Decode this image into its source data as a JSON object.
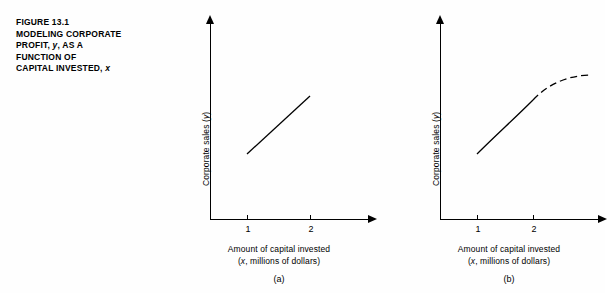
{
  "caption": {
    "figure_label": "FIGURE 13.1",
    "lines": [
      "MODELING CORPORATE",
      "PROFIT, y, AS A",
      "FUNCTION OF",
      "CAPITAL INVESTED, x"
    ]
  },
  "panels": [
    {
      "sub_label": "(a)",
      "ylabel": "Corporate sales (y)",
      "xlabel_line1": "Amount of capital invested",
      "xlabel_line2": "(x, millions of dollars)",
      "ticks": [
        "1",
        "2"
      ]
    },
    {
      "sub_label": "(b)",
      "ylabel": "Corporate sales (y)",
      "xlabel_line1": "Amount of capital invested",
      "xlabel_line2": "(x, millions of dollars)",
      "ticks": [
        "1",
        "2"
      ]
    }
  ],
  "chart_data": {
    "type": "line",
    "title": "FIGURE 13.1 MODELING CORPORATE PROFIT, y, AS A FUNCTION OF CAPITAL INVESTED, x",
    "xlabel": "Amount of capital invested (x, millions of dollars)",
    "ylabel": "Corporate sales (y)",
    "grid": false,
    "legend": "none",
    "xlim": [
      0,
      2.8
    ],
    "ylim": [
      0,
      1
    ],
    "panels": [
      {
        "name": "(a)",
        "description": "Straight line (linear model) from x=1 to x=2",
        "series": [
          {
            "name": "linear-segment",
            "style": "solid",
            "x": [
              1,
              2
            ],
            "y": [
              0.38,
              0.78
            ]
          }
        ],
        "xticks": [
          1,
          2
        ],
        "xticklabels": [
          "1",
          "2"
        ]
      },
      {
        "name": "(b)",
        "description": "Solid curved line from x=1 to x=2, continuing as a dashed leveling-off curve beyond x=2",
        "series": [
          {
            "name": "observed-curve",
            "style": "solid",
            "x": [
              1,
              1.35,
              1.7,
              2
            ],
            "y": [
              0.38,
              0.56,
              0.71,
              0.81
            ]
          },
          {
            "name": "extrapolated-curve",
            "style": "dashed",
            "x": [
              2,
              2.25,
              2.5,
              2.75
            ],
            "y": [
              0.81,
              0.88,
              0.92,
              0.93
            ]
          }
        ],
        "xticks": [
          1,
          2
        ],
        "xticklabels": [
          "1",
          "2"
        ]
      }
    ]
  }
}
